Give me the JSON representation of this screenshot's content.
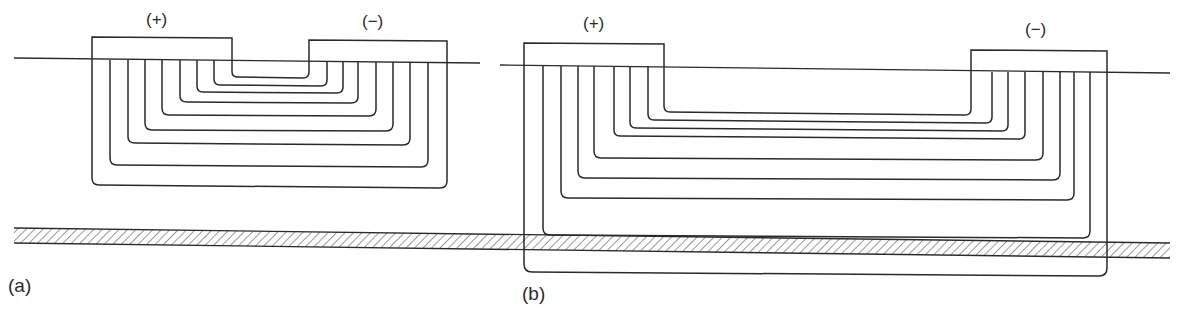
{
  "figure": {
    "colors": {
      "line": "#2a2a2a",
      "hatch": "#555555",
      "background": "#ffffff"
    },
    "panels": [
      {
        "id": "a",
        "label": "(a)",
        "electrodes": [
          {
            "polarity": "(+)"
          },
          {
            "polarity": "(−)"
          }
        ],
        "field_lines": 9,
        "description": "Closely spaced electrodes; nested current/field lines stay above the buried layer"
      },
      {
        "id": "b",
        "label": "(b)",
        "electrodes": [
          {
            "polarity": "(+)"
          },
          {
            "polarity": "(−)"
          }
        ],
        "field_lines": 9,
        "description": "Widely spaced electrodes; deepest field lines penetrate the hatched buried layer"
      }
    ],
    "surface_line": "ground surface",
    "hatched_layer": "buried layer"
  }
}
